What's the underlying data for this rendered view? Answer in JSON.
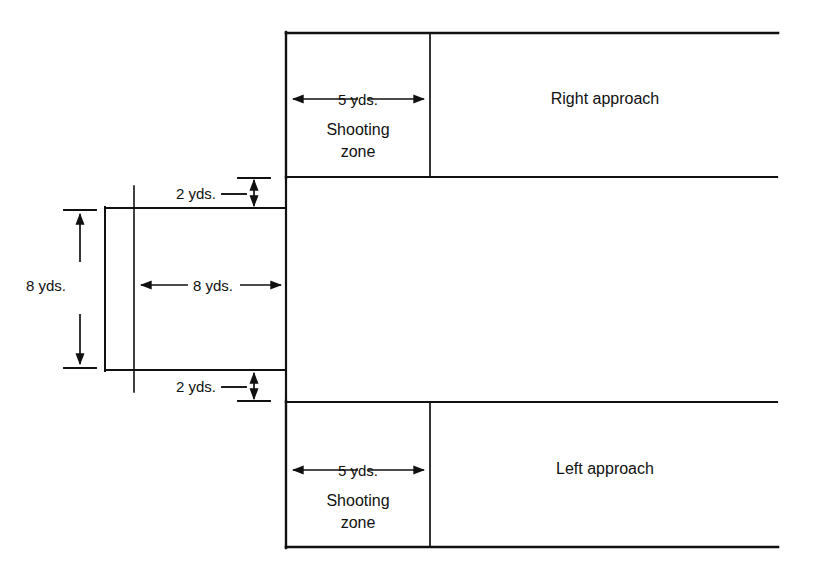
{
  "diagram": {
    "stroke_color": "#111111",
    "background_color": "#ffffff",
    "labels": {
      "right_approach": "Right approach",
      "left_approach": "Left approach",
      "shooting_zone_line1": "Shooting",
      "shooting_zone_line2": "zone",
      "dim_5yds_top": "5 yds.",
      "dim_5yds_bottom": "5 yds.",
      "dim_2yds_top": "2 yds.",
      "dim_2yds_bottom": "2 yds.",
      "dim_8yds_horizontal": "8 yds.",
      "dim_8yds_vertical": "8 yds."
    },
    "dimensions": {
      "shooting_zone_width_yds": 5,
      "goal_offset_yds": 2,
      "goal_width_yds": 8,
      "goal_height_yds": 8,
      "units": "yds."
    },
    "geometry": {
      "top_box": {
        "x": 286,
        "y": 33,
        "width": 492,
        "height": 145
      },
      "bottom_box": {
        "x": 286,
        "y": 402,
        "width": 492,
        "height": 145
      },
      "shooting_zone_divider_top_x": 430,
      "shooting_zone_divider_bottom_x": 430,
      "goal_box": {
        "x": 105,
        "y": 208,
        "width": 181,
        "height": 162
      },
      "goal_line_x": 134,
      "goal_line_top_y": 186,
      "goal_line_bottom_y": 392
    }
  }
}
